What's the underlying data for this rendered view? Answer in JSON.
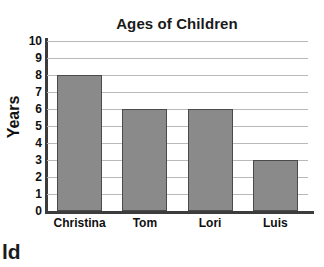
{
  "chart_data": {
    "type": "bar",
    "title": "Ages of Children",
    "xlabel": "",
    "ylabel": "Years",
    "categories": [
      "Christina",
      "Tom",
      "Lori",
      "Luis"
    ],
    "values": [
      8,
      6,
      6,
      3
    ],
    "ylim": [
      0,
      10
    ],
    "ytick_labels": [
      "10",
      "9",
      "8",
      "7",
      "6",
      "5",
      "4",
      "3",
      "2",
      "1",
      "0"
    ],
    "ytick_values": [
      10,
      9,
      8,
      7,
      6,
      5,
      4,
      3,
      2,
      1,
      0
    ],
    "grid": true,
    "legend": false,
    "bar_color": "#8a8a8a",
    "bar_edge_color": "#4a4a4a",
    "gridline_color": "#b9b9b9",
    "axis_color": "#3c3c3c"
  },
  "artifacts": {
    "clipped_text": "ld"
  }
}
